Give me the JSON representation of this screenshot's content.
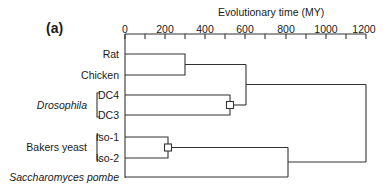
{
  "panel_label": "(a)",
  "axis": {
    "title": "Evolutionary time (MY)",
    "tick_labels": [
      "0",
      "200",
      "400",
      "600",
      "800",
      "1000",
      "1200"
    ],
    "range": [
      0,
      1200
    ],
    "minor_tick_step": 100
  },
  "taxa": {
    "rat": "Rat",
    "chicken": "Chicken",
    "drosophila_group": "Drosophila",
    "dc4": "DC4",
    "dc3": "DC3",
    "yeast_group": "Bakers yeast",
    "iso1": "Iso-1",
    "iso2": "Iso-2",
    "pombe": "Saccharomyces pombe"
  },
  "tree": {
    "nodes": [
      {
        "join": [
          "Rat",
          "Chicken"
        ],
        "time_my": 300,
        "marker": false
      },
      {
        "join": [
          "DC4",
          "DC3"
        ],
        "time_my": 525,
        "marker": true
      },
      {
        "join": [
          "Rat+Chicken",
          "DC4+DC3"
        ],
        "time_my": 600,
        "marker": false
      },
      {
        "join": [
          "Iso-1",
          "Iso-2"
        ],
        "time_my": 215,
        "marker": true
      },
      {
        "join": [
          "Iso-1+Iso-2",
          "Saccharomyces pombe"
        ],
        "time_my": 810,
        "marker": false
      },
      {
        "join": [
          "Animals",
          "Yeasts"
        ],
        "time_my": 1200,
        "marker": false
      }
    ]
  }
}
